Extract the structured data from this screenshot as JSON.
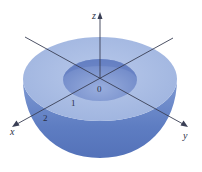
{
  "figure": {
    "type": "hemispherical-shell",
    "axes": {
      "x_label": "x",
      "y_label": "y",
      "z_label": "z"
    },
    "origin_label": "0",
    "tick_labels": [
      "1",
      "2"
    ],
    "colors": {
      "shell_outer_side": "#5b7cc2",
      "rim_top": "#a9bde3",
      "inner_hole": "#7d96d1",
      "axis_line": "#3a3f55",
      "background": "#ffffff"
    }
  }
}
